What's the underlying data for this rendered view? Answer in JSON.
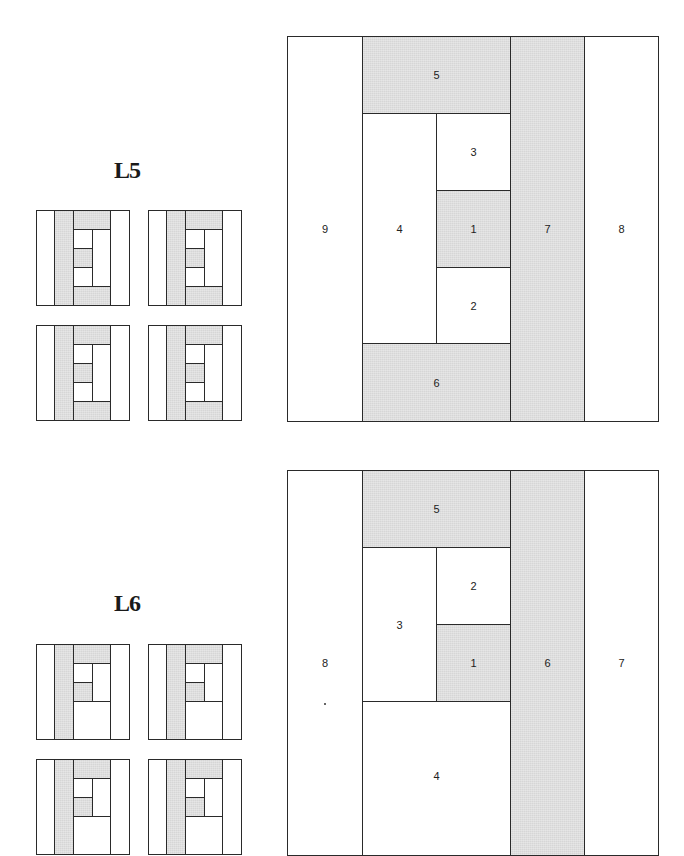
{
  "blocks": [
    {
      "label": "L5",
      "pieces": {
        "p1": "1",
        "p2": "2",
        "p3": "3",
        "p4": "4",
        "p5": "5",
        "p6": "6",
        "p7": "7",
        "p8": "8",
        "p9": "9"
      }
    },
    {
      "label": "L6",
      "pieces": {
        "p1": "1",
        "p2": "2",
        "p3": "3",
        "p4": "4",
        "p5": "5",
        "p6": "6",
        "p7": "7",
        "p8": "8"
      }
    }
  ],
  "colors": {
    "shaded": "#d6d6d6",
    "unshaded": "#ffffff",
    "line": "#2a2a2a"
  }
}
